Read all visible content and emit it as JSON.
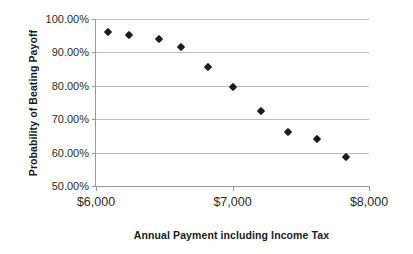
{
  "chart_data": {
    "type": "scatter",
    "title": "",
    "xlabel": "Annual Payment including Income Tax",
    "ylabel": "Probability of Beating Payoff",
    "xlim": [
      6000,
      8000
    ],
    "ylim": [
      50,
      100
    ],
    "grid": true,
    "legend": "none",
    "marker": "diamond",
    "marker_color": "#1c1c1c",
    "x_tick_labels": [
      "$6,000",
      "$7,000",
      "$8,000"
    ],
    "x_tick_values": [
      6000,
      7000,
      8000
    ],
    "y_tick_labels": [
      "50.00%",
      "60.00%",
      "70.00%",
      "80.00%",
      "90.00%",
      "100.00%"
    ],
    "y_tick_values": [
      50,
      60,
      70,
      80,
      90,
      100
    ],
    "series": [
      {
        "name": "Probability of Beating Payoff",
        "points": [
          {
            "x": 6090,
            "y": 96.0
          },
          {
            "x": 6240,
            "y": 95.3
          },
          {
            "x": 6460,
            "y": 93.9
          },
          {
            "x": 6625,
            "y": 91.6
          },
          {
            "x": 6820,
            "y": 85.6
          },
          {
            "x": 7000,
            "y": 79.6
          },
          {
            "x": 7210,
            "y": 72.5
          },
          {
            "x": 7410,
            "y": 66.3
          },
          {
            "x": 7620,
            "y": 64.0
          },
          {
            "x": 7830,
            "y": 58.8
          }
        ]
      }
    ]
  }
}
